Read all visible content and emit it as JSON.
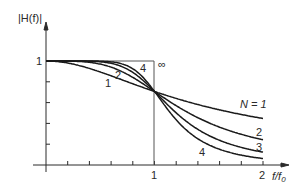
{
  "chart_data": {
    "type": "line",
    "title": "",
    "ylabel": "|H(f)|",
    "xlabel": "f/f0",
    "xlim": [
      0,
      2
    ],
    "ylim": [
      0,
      1
    ],
    "x_tick_step": 0.2,
    "y_tick_step": 0.2,
    "x_tick_labels": [
      "1",
      "2"
    ],
    "y_tick_labels": [
      "1"
    ],
    "grid": false,
    "formula": "|H| = 1 / sqrt(1 + (f/f0)^(2N))",
    "series": [
      {
        "name": "N = 1",
        "label": "N = 1",
        "N": 1,
        "x": [
          0,
          0.5,
          1,
          1.5,
          2
        ],
        "values": [
          1.0,
          0.894,
          0.707,
          0.555,
          0.447
        ]
      },
      {
        "name": "2",
        "label": "2",
        "N": 2,
        "x": [
          0,
          0.5,
          1,
          1.5,
          2
        ],
        "values": [
          1.0,
          0.97,
          0.707,
          0.406,
          0.243
        ]
      },
      {
        "name": "3",
        "label": "3",
        "N": 3,
        "x": [
          0,
          0.5,
          1,
          1.5,
          2
        ],
        "values": [
          1.0,
          0.992,
          0.707,
          0.284,
          0.124
        ]
      },
      {
        "name": "4",
        "label": "4",
        "N": 4,
        "x": [
          0,
          0.5,
          1,
          1.5,
          2
        ],
        "values": [
          1.0,
          0.998,
          0.707,
          0.194,
          0.062
        ]
      },
      {
        "name": "∞",
        "label": "∞",
        "N": "infinity",
        "x": [
          0,
          1,
          1
        ],
        "values": [
          1,
          1,
          0
        ]
      }
    ],
    "annotations": [
      {
        "text": "1",
        "near": "N=1 curve, left region"
      },
      {
        "text": "2",
        "near": "N=2 curve, left region"
      },
      {
        "text": "4",
        "near": "N=4 curve, left region"
      },
      {
        "text": "∞",
        "near": "ideal brick-wall corner at f/f0=1"
      }
    ]
  },
  "labels": {
    "ylabel": "|H(f)|",
    "xlabel_main": "f/f",
    "xlabel_sub": "0",
    "y_one": "1",
    "x_one": "1",
    "x_two": "2",
    "inf": "∞",
    "left_1": "1",
    "left_2": "2",
    "left_4": "4",
    "right_n1": "N = 1",
    "right_2": "2",
    "right_3": "3",
    "right_4": "4"
  }
}
